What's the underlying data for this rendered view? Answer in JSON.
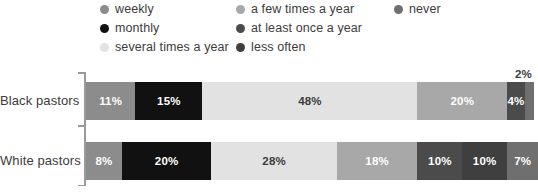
{
  "legend": {
    "columns": [
      {
        "items": [
          {
            "label": "weekly",
            "color": "#8c8c8c",
            "icon": "legend-dot-icon"
          },
          {
            "label": "monthly",
            "color": "#111111",
            "icon": "legend-dot-icon"
          },
          {
            "label": "several times a year",
            "color": "#e2e2e2",
            "icon": "legend-dot-icon"
          }
        ]
      },
      {
        "items": [
          {
            "label": "a few times a year",
            "color": "#a8a8a8",
            "icon": "legend-dot-icon"
          },
          {
            "label": "at least once a year",
            "color": "#4b4b4b",
            "icon": "legend-dot-icon"
          },
          {
            "label": "less often",
            "color": "#3f3f3f",
            "icon": "legend-dot-icon"
          }
        ]
      },
      {
        "items": [
          {
            "label": "never",
            "color": "#6f6f6f",
            "icon": "legend-dot-icon"
          }
        ]
      }
    ]
  },
  "chart_data": {
    "type": "bar",
    "orientation": "horizontal",
    "stacked": true,
    "stack_total": 100,
    "title": "",
    "xlabel": "",
    "ylabel": "",
    "xlim": [
      0,
      100
    ],
    "grid": false,
    "legend_position": "top",
    "categories": [
      "Black pastors",
      "White pastors"
    ],
    "series": [
      {
        "name": "weekly",
        "color": "#8c8c8c",
        "values": [
          11,
          8
        ]
      },
      {
        "name": "monthly",
        "color": "#111111",
        "values": [
          15,
          20
        ]
      },
      {
        "name": "several times a year",
        "color": "#e2e2e2",
        "values": [
          48,
          28
        ]
      },
      {
        "name": "a few times a year",
        "color": "#a8a8a8",
        "values": [
          20,
          18
        ]
      },
      {
        "name": "at least once a year",
        "color": "#4b4b4b",
        "values": [
          4,
          10
        ]
      },
      {
        "name": "less often",
        "color": "#3f3f3f",
        "values": [
          2,
          10
        ]
      },
      {
        "name": "never",
        "color": "#6f6f6f",
        "values": [
          0,
          7
        ]
      }
    ],
    "rows": [
      {
        "category": "Black pastors",
        "segments": [
          {
            "name": "weekly",
            "value": 11,
            "label": "11%",
            "color": "#8c8c8c",
            "text_color": "#ffffff",
            "label_placement": "inside"
          },
          {
            "name": "monthly",
            "value": 15,
            "label": "15%",
            "color": "#111111",
            "text_color": "#ffffff",
            "label_placement": "inside"
          },
          {
            "name": "several times a year",
            "value": 48,
            "label": "48%",
            "color": "#e2e2e2",
            "text_color": "#3c3c3c",
            "label_placement": "inside"
          },
          {
            "name": "a few times a year",
            "value": 20,
            "label": "20%",
            "color": "#a8a8a8",
            "text_color": "#ffffff",
            "label_placement": "inside"
          },
          {
            "name": "at least once a year",
            "value": 4,
            "label": "4%",
            "color": "#4b4b4b",
            "text_color": "#ffffff",
            "label_placement": "inside"
          },
          {
            "name": "less often",
            "value": 2,
            "label": "2%",
            "color": "#6f6f6f",
            "text_color": "#3c3c3c",
            "label_placement": "outside"
          }
        ]
      },
      {
        "category": "White pastors",
        "segments": [
          {
            "name": "weekly",
            "value": 8,
            "label": "8%",
            "color": "#8c8c8c",
            "text_color": "#ffffff",
            "label_placement": "inside"
          },
          {
            "name": "monthly",
            "value": 20,
            "label": "20%",
            "color": "#111111",
            "text_color": "#ffffff",
            "label_placement": "inside"
          },
          {
            "name": "several times a year",
            "value": 28,
            "label": "28%",
            "color": "#e2e2e2",
            "text_color": "#3c3c3c",
            "label_placement": "inside"
          },
          {
            "name": "a few times a year",
            "value": 18,
            "label": "18%",
            "color": "#a8a8a8",
            "text_color": "#ffffff",
            "label_placement": "inside"
          },
          {
            "name": "at least once a year",
            "value": 10,
            "label": "10%",
            "color": "#4b4b4b",
            "text_color": "#ffffff",
            "label_placement": "inside"
          },
          {
            "name": "less often",
            "value": 10,
            "label": "10%",
            "color": "#3f3f3f",
            "text_color": "#ffffff",
            "label_placement": "inside"
          },
          {
            "name": "never",
            "value": 7,
            "label": "7%",
            "color": "#6f6f6f",
            "text_color": "#ffffff",
            "label_placement": "inside"
          }
        ]
      }
    ]
  }
}
